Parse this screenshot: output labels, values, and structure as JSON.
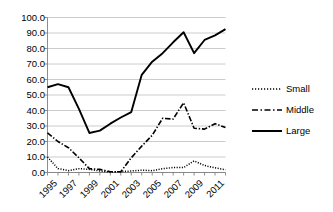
{
  "chart_data": {
    "type": "line",
    "title": "",
    "subtitle": "",
    "xlabel": "",
    "ylabel": "",
    "x": [
      1995,
      1996,
      1997,
      1998,
      1999,
      2000,
      2001,
      2002,
      2003,
      2004,
      2005,
      2006,
      2007,
      2008,
      2009,
      2010,
      2011,
      2012
    ],
    "categories": [
      "1995",
      "1996",
      "1997",
      "1998",
      "1999",
      "2000",
      "2001",
      "2002",
      "2003",
      "2004",
      "2005",
      "2006",
      "2007",
      "2008",
      "2009",
      "2010",
      "2011",
      "2012"
    ],
    "tick_labels_x": [
      "1995",
      "1997",
      "1999",
      "2001",
      "2003",
      "2005",
      "2007",
      "2009",
      "2011"
    ],
    "tick_labels_y": [
      "0.0",
      "10.0",
      "20.0",
      "30.0",
      "40.0",
      "50.0",
      "60.0",
      "70.0",
      "80.0",
      "90.0",
      "100.0"
    ],
    "ylim": [
      0,
      100
    ],
    "ytick_step": 10,
    "xlim": [
      1995,
      2012
    ],
    "grid": "horizontal",
    "legend_position": "right",
    "series": [
      {
        "name": "Small",
        "style": "dotted",
        "color": "#000000",
        "values": [
          10.0,
          2.5,
          1.2,
          2.5,
          2.0,
          1.0,
          0.3,
          0.5,
          1.0,
          1.5,
          1.2,
          2.5,
          3.2,
          3.2,
          7.5,
          4.5,
          3.0,
          1.8
        ]
      },
      {
        "name": "Middle",
        "style": "dash-dot",
        "color": "#000000",
        "values": [
          25.5,
          20.0,
          16.0,
          9.5,
          2.5,
          2.0,
          0.5,
          0.5,
          9.5,
          17.0,
          24.0,
          35.0,
          34.5,
          45.0,
          28.5,
          28.0,
          31.5,
          29.0
        ]
      },
      {
        "name": "Large",
        "style": "solid",
        "color": "#000000",
        "values": [
          55.0,
          57.0,
          55.0,
          41.0,
          25.5,
          27.0,
          31.5,
          35.5,
          39.0,
          63.0,
          71.5,
          77.0,
          84.0,
          90.5,
          77.0,
          85.5,
          88.5,
          92.5
        ]
      }
    ]
  },
  "legend": {
    "items": [
      {
        "label": "Small"
      },
      {
        "label": "Middle"
      },
      {
        "label": "Large"
      }
    ]
  },
  "axes": {
    "y_labels": [
      "100.0",
      "90.0",
      "80.0",
      "70.0",
      "60.0",
      "50.0",
      "40.0",
      "30.0",
      "20.0",
      "10.0",
      "0.0"
    ],
    "x_labels": [
      "1995",
      "1997",
      "1999",
      "2001",
      "2003",
      "2005",
      "2007",
      "2009",
      "2011"
    ]
  },
  "colors": {
    "line": "#000000",
    "grid": "#bfbfbf",
    "axis": "#808080",
    "background": "#ffffff"
  }
}
